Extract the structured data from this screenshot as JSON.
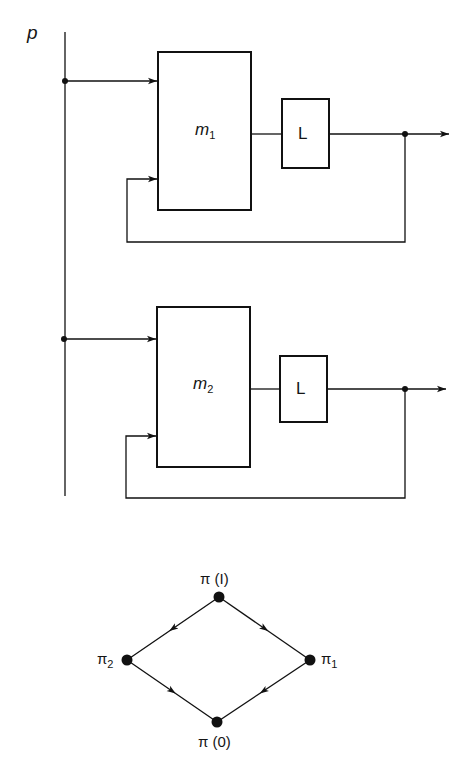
{
  "diagram": {
    "input_label": "p",
    "blocks": [
      {
        "name": "m",
        "subscript": "1",
        "box": [
          158,
          52,
          93,
          158
        ],
        "delay_label": "L",
        "delay_box": [
          282,
          99,
          47,
          69
        ],
        "output_y": 134,
        "feedback_y": 179,
        "input_y": 81,
        "feedback_bottom": 242
      },
      {
        "name": "m",
        "subscript": "2",
        "box": [
          157,
          307,
          93,
          160
        ],
        "delay_label": "L",
        "delay_box": [
          280,
          356,
          47,
          66
        ],
        "output_y": 389,
        "feedback_y": 436,
        "input_y": 339,
        "feedback_bottom": 498
      }
    ],
    "lattice": {
      "nodes": [
        {
          "id": "top",
          "label": "π (I)",
          "x": 219,
          "y": 597
        },
        {
          "id": "left",
          "label": "π",
          "subscript": "2",
          "x": 127,
          "y": 660
        },
        {
          "id": "right",
          "label": "π",
          "subscript": "1",
          "x": 310,
          "y": 660
        },
        {
          "id": "bottom",
          "label": "π (0)",
          "x": 217,
          "y": 722
        }
      ],
      "edges": [
        [
          "top",
          "left"
        ],
        [
          "top",
          "right"
        ],
        [
          "left",
          "bottom"
        ],
        [
          "right",
          "bottom"
        ]
      ]
    }
  },
  "labels": {
    "p": "p",
    "m": "m",
    "sub1": "1",
    "sub2": "2",
    "L": "L",
    "pi_top": "π (I)",
    "pi": "π",
    "pi_bottom": "π (0)"
  }
}
